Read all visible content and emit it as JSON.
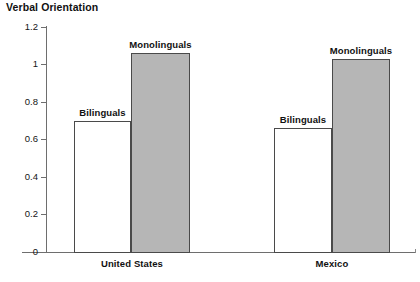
{
  "chart_data": {
    "type": "bar",
    "title": "Verbal Orientation",
    "xlabel": "",
    "ylabel": "Verbal Orientation",
    "ylim": [
      0,
      1.2
    ],
    "yticks": [
      "0",
      "0.2",
      "0.4",
      "0.6",
      "0.8",
      "1",
      "1.2"
    ],
    "ytick_values": [
      0,
      0.2,
      0.4,
      0.6,
      0.8,
      1,
      1.2
    ],
    "grid": false,
    "legend": "none (bars labelled in-place)",
    "categories": [
      "United States",
      "Mexico"
    ],
    "series": [
      {
        "name": "Bilinguals",
        "values": [
          0.7,
          0.66
        ],
        "fill": "#ffffff"
      },
      {
        "name": "Monolinguals",
        "values": [
          1.06,
          1.03
        ],
        "fill": "#b6b6b6"
      }
    ],
    "bars": [
      {
        "group": "United States",
        "series": "Bilinguals",
        "value": 0.7,
        "label": "Bilinguals"
      },
      {
        "group": "United States",
        "series": "Monolinguals",
        "value": 1.06,
        "label": "Monolinguals"
      },
      {
        "group": "Mexico",
        "series": "Bilinguals",
        "value": 0.66,
        "label": "Bilinguals"
      },
      {
        "group": "Mexico",
        "series": "Monolinguals",
        "value": 1.03,
        "label": "Monolinguals"
      }
    ]
  },
  "colors": {
    "axis": "#6e6e6e",
    "bar_outline": "#4a4a4a",
    "bar_open_fill": "#ffffff",
    "bar_filled_fill": "#b6b6b6",
    "background": "#ffffff",
    "text": "#111111"
  }
}
